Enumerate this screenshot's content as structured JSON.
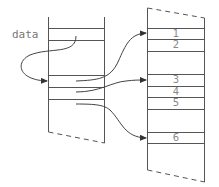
{
  "diagram": {
    "label": "data",
    "right_box_slots": [
      "1",
      "2",
      "3",
      "4",
      "5",
      "6"
    ],
    "arrows": [
      {
        "from": "data",
        "to": "left-slot-3"
      },
      {
        "from": "left-slot-3",
        "to": "right-slot-1"
      },
      {
        "from": "left-slot-4",
        "to": "right-slot-3"
      },
      {
        "from": "left-slot-5",
        "to": "right-slot-6"
      }
    ],
    "colors": {
      "line": "#555555",
      "text": "#777777"
    }
  }
}
